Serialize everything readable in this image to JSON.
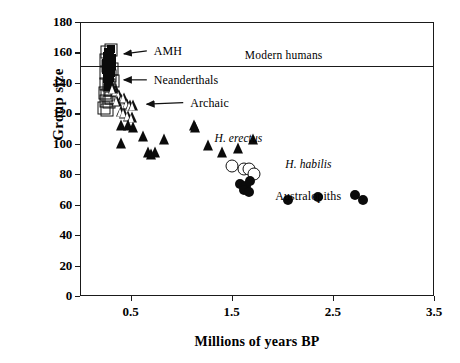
{
  "chart_data": {
    "type": "scatter",
    "title": "",
    "xlabel": "Millions of years BP",
    "ylabel": "Group size",
    "xlim": [
      0.0,
      3.5
    ],
    "ylim": [
      0,
      180
    ],
    "xticks": [
      0.5,
      1.5,
      2.5,
      3.5
    ],
    "xtick_labels": [
      "0.5",
      "1.5",
      "2.5",
      "3.5"
    ],
    "yticks": [
      0,
      20,
      40,
      60,
      80,
      100,
      120,
      140,
      160,
      180
    ],
    "ytick_labels": [
      "0",
      "20",
      "40",
      "60",
      "80",
      "100",
      "120",
      "140",
      "160",
      "180"
    ],
    "grid": false,
    "legend": "none",
    "reference_lines": [
      {
        "name": "modern-humans-line",
        "orientation": "horizontal",
        "y": 152,
        "label": "Modern humans"
      }
    ],
    "annotations": [
      {
        "name": "amh-label",
        "text": "AMH",
        "x": 0.72,
        "y": 161,
        "arrow_to_x": 0.345,
        "arrow_to_y": 159,
        "style": "arrow"
      },
      {
        "name": "neanderthals-label",
        "text": "Neanderthals",
        "x": 0.72,
        "y": 142,
        "arrow_to_x": 0.345,
        "arrow_to_y": 142,
        "style": "arrow"
      },
      {
        "name": "archaic-label",
        "text": "Archaic",
        "x": 1.08,
        "y": 127,
        "arrow_to_x": 0.57,
        "arrow_to_y": 126,
        "style": "arrow"
      },
      {
        "name": "h-erectus-label",
        "text": "H. erectus",
        "x": 1.32,
        "y": 103,
        "style": "italic"
      },
      {
        "name": "h-habilis-label",
        "text": "H. habilis",
        "x": 2.02,
        "y": 86,
        "style": "italic"
      },
      {
        "name": "australopiths-label",
        "text": "Australopiths",
        "x": 1.92,
        "y": 66,
        "style": "plain"
      }
    ],
    "series": [
      {
        "name": "Neanderthals",
        "marker": "open-square",
        "points": [
          [
            0.255,
            161
          ],
          [
            0.295,
            162
          ],
          [
            0.268,
            152
          ],
          [
            0.302,
            150
          ],
          [
            0.247,
            147
          ],
          [
            0.282,
            145
          ],
          [
            0.243,
            140
          ],
          [
            0.272,
            139
          ],
          [
            0.236,
            134
          ],
          [
            0.262,
            133
          ],
          [
            0.288,
            136
          ],
          [
            0.246,
            129
          ],
          [
            0.276,
            128
          ],
          [
            0.232,
            124
          ],
          [
            0.262,
            123
          ],
          [
            0.3,
            131
          ],
          [
            0.318,
            142
          ],
          [
            0.252,
            156
          ]
        ]
      },
      {
        "name": "AMH",
        "marker": "filled-square",
        "points": [
          [
            0.258,
            158
          ],
          [
            0.282,
            159
          ],
          [
            0.302,
            157
          ],
          [
            0.265,
            155
          ],
          [
            0.288,
            153
          ],
          [
            0.248,
            154
          ],
          [
            0.272,
            151
          ],
          [
            0.295,
            150
          ],
          [
            0.252,
            149
          ],
          [
            0.276,
            148
          ],
          [
            0.3,
            147
          ],
          [
            0.262,
            146
          ],
          [
            0.285,
            144
          ],
          [
            0.308,
            152
          ],
          [
            0.268,
            161
          ],
          [
            0.292,
            163
          ],
          [
            0.256,
            143
          ],
          [
            0.279,
            141
          ],
          [
            0.266,
            138
          ]
        ]
      },
      {
        "name": "Archaic",
        "marker": "open-triangle",
        "points": [
          [
            0.345,
            136
          ],
          [
            0.372,
            133
          ],
          [
            0.4,
            130
          ],
          [
            0.428,
            131
          ],
          [
            0.452,
            127
          ],
          [
            0.482,
            126
          ],
          [
            0.512,
            126
          ],
          [
            0.395,
            122
          ],
          [
            0.425,
            121
          ],
          [
            0.465,
            119
          ],
          [
            0.5,
            118
          ],
          [
            0.352,
            129
          ],
          [
            0.318,
            137
          ]
        ]
      },
      {
        "name": "H. erectus",
        "marker": "filled-triangle",
        "points": [
          [
            0.4,
            113
          ],
          [
            0.462,
            113
          ],
          [
            0.512,
            112
          ],
          [
            0.392,
            101
          ],
          [
            0.612,
            106
          ],
          [
            0.66,
            95
          ],
          [
            0.69,
            94
          ],
          [
            0.822,
            104
          ],
          [
            1.122,
            113
          ],
          [
            1.252,
            100
          ],
          [
            1.392,
            95
          ],
          [
            1.552,
            98
          ],
          [
            1.702,
            104
          ],
          [
            0.735,
            95
          ],
          [
            1.132,
            112
          ]
        ]
      },
      {
        "name": "H. habilis",
        "marker": "open-circle",
        "points": [
          [
            1.492,
            86
          ],
          [
            1.612,
            84
          ],
          [
            1.662,
            84
          ],
          [
            1.712,
            81
          ]
        ]
      },
      {
        "name": "Australopiths",
        "marker": "filled-circle",
        "points": [
          [
            1.572,
            74
          ],
          [
            1.632,
            73
          ],
          [
            1.672,
            76
          ],
          [
            1.612,
            70
          ],
          [
            1.662,
            69
          ],
          [
            2.042,
            64
          ],
          [
            2.342,
            66
          ],
          [
            2.712,
            67
          ],
          [
            2.792,
            64
          ]
        ]
      }
    ]
  },
  "colors": {
    "ink": "#111111",
    "axis": "#1a1a1a",
    "background": "#ffffff"
  }
}
